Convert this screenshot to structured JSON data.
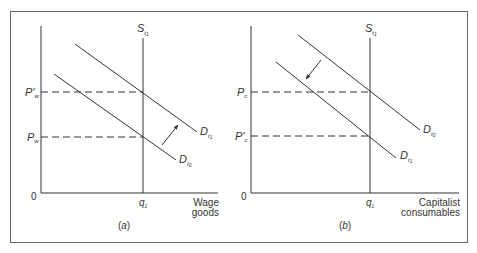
{
  "figure": {
    "border_color": "#555555",
    "line_color": "#333333",
    "panels": [
      {
        "id": "a",
        "caption_open": "(",
        "caption_letter": "a",
        "caption_close": ")",
        "origin": "0",
        "x_axis_label_line1": "Wage",
        "x_axis_label_line2": "goods",
        "quantity_label": "q",
        "quantity_sub": "1",
        "supply_label": "S",
        "supply_sub": "t",
        "supply_subsub": "1",
        "price_high_label": "P'",
        "price_high_sub": "w",
        "price_low_label": "P",
        "price_low_sub": "w",
        "demand_new_label": "D",
        "demand_new_sub": "t",
        "demand_new_subsub": "1",
        "demand_old_label": "D",
        "demand_old_sub": "t",
        "demand_old_subsub": "0",
        "shift_direction": "outward (up-right)"
      },
      {
        "id": "b",
        "caption_open": "(",
        "caption_letter": "b",
        "caption_close": ")",
        "origin": "0",
        "x_axis_label_line1": "Capitalist",
        "x_axis_label_line2": "consumables",
        "quantity_label": "q",
        "quantity_sub": "1",
        "supply_label": "S",
        "supply_sub": "t",
        "supply_subsub": "1",
        "price_high_label": "P",
        "price_high_sub": "c",
        "price_low_label": "P'",
        "price_low_sub": "c",
        "demand_old_label": "D",
        "demand_old_sub": "t",
        "demand_old_subsub": "0",
        "demand_new_label": "D",
        "demand_new_sub": "t",
        "demand_new_subsub": "1",
        "shift_direction": "inward (down-left)"
      }
    ]
  }
}
